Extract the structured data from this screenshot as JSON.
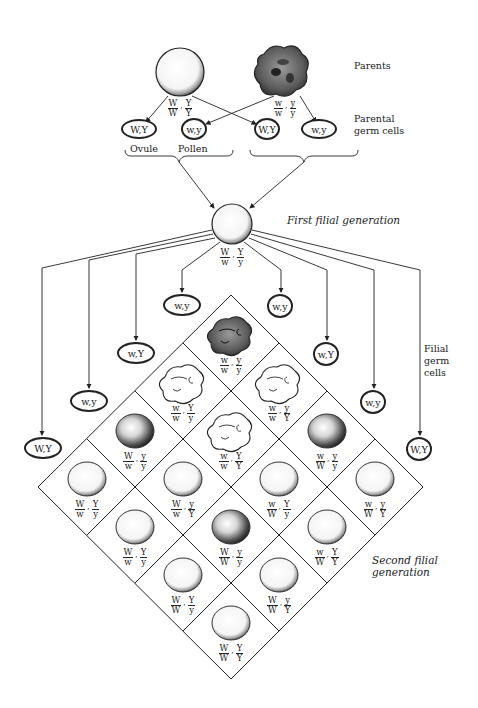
{
  "labels": {
    "parents": "Parents",
    "parental_germ_cells_1": "Parental",
    "parental_germ_cells_2": "germ cells",
    "ovule": "Ovule",
    "pollen": "Pollen",
    "first_filial": "First filial generation",
    "filial_germ_1": "Filial",
    "filial_germ_2": "germ",
    "filial_germ_3": "cells",
    "second_filial_1": "Second filial",
    "second_filial_2": "generation"
  },
  "parents": [
    {
      "type": "round",
      "genotype": {
        "a_num": "W",
        "a_den": "W",
        "b_num": "Y",
        "b_den": "Y"
      }
    },
    {
      "type": "wrinkled-dark",
      "genotype": {
        "a_num": "w",
        "a_den": "w",
        "b_num": "y",
        "b_den": "y"
      }
    }
  ],
  "parental_gametes": [
    "W,Y",
    "w,y",
    "W,Y",
    "w,y"
  ],
  "f1": {
    "type": "round",
    "genotype": {
      "a_num": "W",
      "a_den": "w",
      "b_num": "Y",
      "b_den": "y"
    }
  },
  "filial_gametes_left": [
    "W,Y",
    "w,y",
    "w,Y",
    "w,y"
  ],
  "filial_gametes_right": [
    "w,y",
    "w,Y",
    "w,y",
    "W,Y"
  ],
  "grid": [
    {
      "pos": "0-0",
      "type": "wrinkled-dark",
      "a_num": "w",
      "a_den": "w",
      "b_num": "y",
      "b_den": "y"
    },
    {
      "pos": "1-0",
      "type": "wrinkled",
      "a_num": "w",
      "a_den": "w",
      "b_num": "Y",
      "b_den": "y"
    },
    {
      "pos": "0-1",
      "type": "wrinkled",
      "a_num": "w",
      "a_den": "w",
      "b_num": "y",
      "b_den": "Y"
    },
    {
      "pos": "2-0",
      "type": "round-dark",
      "a_num": "W",
      "a_den": "w",
      "b_num": "y",
      "b_den": "y"
    },
    {
      "pos": "1-1",
      "type": "wrinkled",
      "a_num": "w",
      "a_den": "w",
      "b_num": "Y",
      "b_den": "Y"
    },
    {
      "pos": "0-2",
      "type": "round-dark",
      "a_num": "w",
      "a_den": "W",
      "b_num": "y",
      "b_den": "y"
    },
    {
      "pos": "3-0",
      "type": "round",
      "a_num": "W",
      "a_den": "w",
      "b_num": "Y",
      "b_den": "y"
    },
    {
      "pos": "2-1",
      "type": "round",
      "a_num": "W",
      "a_den": "w",
      "b_num": "y",
      "b_den": "Y"
    },
    {
      "pos": "1-2",
      "type": "round",
      "a_num": "w",
      "a_den": "W",
      "b_num": "Y",
      "b_den": "y"
    },
    {
      "pos": "0-3",
      "type": "round",
      "a_num": "w",
      "a_den": "W",
      "b_num": "y",
      "b_den": "Y"
    },
    {
      "pos": "3-1",
      "type": "round",
      "a_num": "W",
      "a_den": "w",
      "b_num": "Y",
      "b_den": "y"
    },
    {
      "pos": "2-2",
      "type": "round-dark",
      "a_num": "W",
      "a_den": "W",
      "b_num": "y",
      "b_den": "y"
    },
    {
      "pos": "1-3",
      "type": "round",
      "a_num": "w",
      "a_den": "W",
      "b_num": "Y",
      "b_den": "Y"
    },
    {
      "pos": "3-2",
      "type": "round",
      "a_num": "W",
      "a_den": "W",
      "b_num": "Y",
      "b_den": "y"
    },
    {
      "pos": "2-3",
      "type": "round",
      "a_num": "W",
      "a_den": "W",
      "b_num": "y",
      "b_den": "Y"
    },
    {
      "pos": "3-3",
      "type": "round",
      "a_num": "W",
      "a_den": "W",
      "b_num": "Y",
      "b_den": "Y"
    }
  ]
}
